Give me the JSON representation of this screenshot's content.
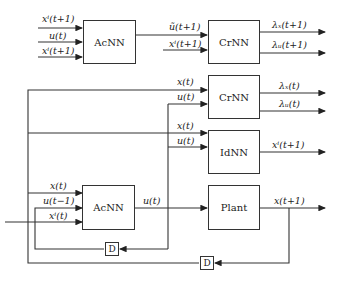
{
  "blocks": {
    "acnn_top": "AcNN",
    "crnn_top": "CrNN",
    "crnn_mid": "CrNN",
    "idnn": "IdNN",
    "acnn_bottom": "AcNN",
    "plant": "Plant",
    "delay1": "D",
    "delay2": "D"
  },
  "labels": {
    "acnn_top_in1": "xⁱ(t+1)",
    "acnn_top_in2": "u(t)",
    "acnn_top_in3": "xⁱ(t+1)",
    "crnn_top_in1": "ũ(t+1)",
    "crnn_top_in2": "xⁱ(t+1)",
    "crnn_top_out1": "λₓ(t+1)",
    "crnn_top_out2": "λᵤ(t+1)",
    "crnn_mid_in1": "x(t)",
    "crnn_mid_in2": "u(t)",
    "crnn_mid_out1": "λₓ(t)",
    "crnn_mid_out2": "λᵤ(t)",
    "idnn_in1": "x(t)",
    "idnn_in2": "u(t)",
    "idnn_out": "xⁱ(t+1)",
    "acnn_bot_in1": "x(t)",
    "acnn_bot_in2": "u(t−1)",
    "acnn_bot_in3": "xⁱ(t)",
    "acnn_bot_out": "u(t)",
    "plant_out": "x(t+1)"
  }
}
